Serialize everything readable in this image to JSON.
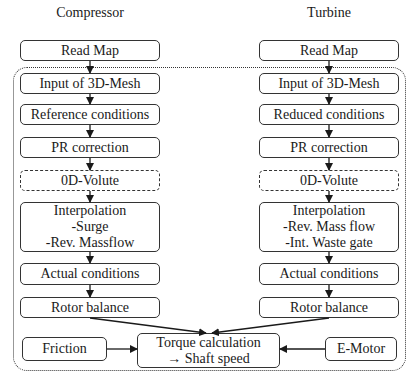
{
  "titles": {
    "left": "Compressor",
    "right": "Turbine"
  },
  "compressor": {
    "read_map": "Read Map",
    "input_mesh": "Input of 3D-Mesh",
    "conditions": "Reference conditions",
    "pr_correction": "PR correction",
    "volute": "0D-Volute",
    "interp_title": "Interpolation",
    "interp_line1": "-Surge",
    "interp_line2": "-Rev. Massflow",
    "actual": "Actual conditions",
    "rotor": "Rotor balance"
  },
  "turbine": {
    "read_map": "Read Map",
    "input_mesh": "Input of 3D-Mesh",
    "conditions": "Reduced conditions",
    "pr_correction": "PR correction",
    "volute": "0D-Volute",
    "interp_title": "Interpolation",
    "interp_line1": "-Rev. Mass flow",
    "interp_line2": "-Int. Waste gate",
    "actual": "Actual conditions",
    "rotor": "Rotor balance"
  },
  "bottom": {
    "friction": "Friction",
    "torque_line1": "Torque calculation",
    "torque_line2": "→ Shaft speed",
    "emotor": "E-Motor"
  }
}
